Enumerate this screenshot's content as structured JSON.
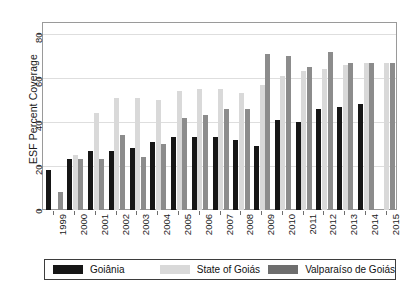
{
  "chart_data": {
    "type": "bar",
    "title": "",
    "xlabel": "",
    "ylabel": "ESF Percent Coverage",
    "ylim": [
      0,
      85
    ],
    "yticks": [
      0,
      20,
      40,
      60,
      80
    ],
    "grid": true,
    "legend_position": "bottom",
    "categories": [
      "1999",
      "2000",
      "2001",
      "2002",
      "2003",
      "2004",
      "2005",
      "2006",
      "2007",
      "2008",
      "2009",
      "2010",
      "2011",
      "2012",
      "2013",
      "2014",
      "2015"
    ],
    "series": [
      {
        "name": "Goiânia",
        "color": "#161616",
        "values": [
          18,
          23,
          27,
          27,
          28,
          31,
          33,
          33,
          33,
          32,
          29,
          41,
          40,
          46,
          47,
          48,
          null
        ]
      },
      {
        "name": "State of Goiás",
        "color": "#d9d9d9",
        "values": [
          null,
          25,
          44,
          51,
          51,
          50,
          54,
          55,
          55,
          53,
          57,
          61,
          63,
          64,
          66,
          67,
          67
        ]
      },
      {
        "name": "Valparaíso de Goiás",
        "color": "#8c8c8c",
        "values": [
          8,
          23,
          23,
          34,
          24,
          30,
          42,
          43,
          46,
          46,
          71,
          70,
          65,
          72,
          67,
          67,
          67
        ]
      }
    ]
  },
  "legend": {
    "items": [
      {
        "label": "Goiânia",
        "swatch": "black-swatch"
      },
      {
        "label": "State of Goiás",
        "swatch": "light-gray-swatch"
      },
      {
        "label": "Valparaíso de Goiás",
        "swatch": "medium-gray-swatch"
      }
    ]
  }
}
